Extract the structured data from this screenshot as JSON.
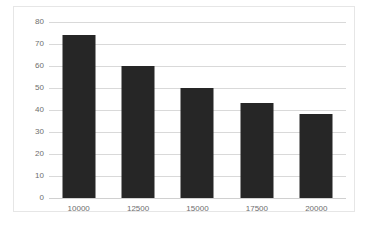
{
  "chart_data": {
    "type": "bar",
    "title": "",
    "subtitle": "",
    "xlabel": "",
    "ylabel": "",
    "categories": [
      "10000",
      "12500",
      "15000",
      "17500",
      "20000"
    ],
    "values": [
      74,
      60,
      50,
      43,
      38
    ],
    "series": [
      {
        "name": "",
        "values": [
          74,
          60,
          50,
          43,
          38
        ]
      }
    ],
    "ylim": [
      0,
      80
    ],
    "yticks": [
      0,
      10,
      20,
      30,
      40,
      50,
      60,
      70,
      80
    ],
    "ytick_labels": [
      "0",
      "10",
      "20",
      "30",
      "40",
      "50",
      "60",
      "70",
      "80"
    ],
    "grid": "horizontal",
    "legend": "none",
    "bar_color": "#262626",
    "gridline_color": "#d9d9d9",
    "frame_color": "#e6e6e6",
    "tick_label_color": "#6e6e6e",
    "plot_background": "#ffffff"
  }
}
